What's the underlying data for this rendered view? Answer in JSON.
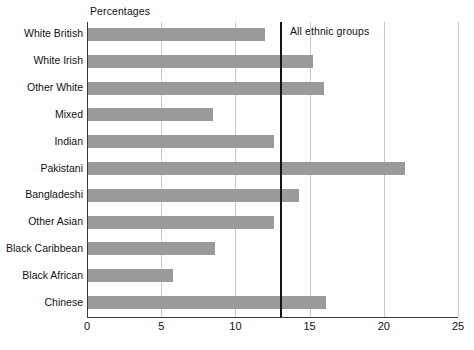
{
  "chart_data": {
    "type": "bar",
    "orientation": "horizontal",
    "title": "",
    "xlabel": "Percentages",
    "ylabel": "",
    "xlim": [
      0,
      25
    ],
    "xticks": [
      0,
      5,
      10,
      15,
      20,
      25
    ],
    "xtick_labels": [
      "0",
      "5",
      "10",
      "15",
      "20",
      "25"
    ],
    "grid": true,
    "legend": false,
    "categories": [
      "White British",
      "White Irish",
      "Other White",
      "Mixed",
      "Indian",
      "Pakistani",
      "Bangladeshi",
      "Other Asian",
      "Black Caribbean",
      "Black African",
      "Chinese"
    ],
    "values": [
      12.0,
      15.2,
      16.0,
      8.5,
      12.6,
      21.4,
      14.3,
      12.6,
      8.6,
      5.8,
      16.1
    ],
    "reference_line": {
      "label": "All ethnic groups",
      "value": 13
    },
    "bar_color": "#9a9a9a",
    "gridline_color": "#c9c9c9",
    "axis_color": "#3a3a3a",
    "reference_line_color": "#141414"
  }
}
